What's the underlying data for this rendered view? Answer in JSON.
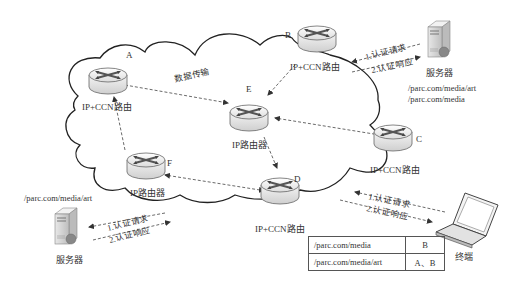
{
  "nodes": {
    "A": {
      "letter": "A",
      "label": "IP+CCN路由",
      "type": "IP+CCN router"
    },
    "B": {
      "letter": "B",
      "label": "IP+CCN路由",
      "type": "IP+CCN router"
    },
    "C": {
      "letter": "C",
      "label": "IP+CCN路由",
      "type": "IP+CCN router"
    },
    "D": {
      "letter": "D",
      "label": "IP+CCN路由",
      "type": "IP+CCN router"
    },
    "E": {
      "letter": "E",
      "label": "IP路由器",
      "type": "IP router"
    },
    "F": {
      "letter": "F",
      "label": "IP路由器",
      "type": "IP router"
    }
  },
  "edges": [
    {
      "from": "A",
      "to": "E",
      "label": "数据传输",
      "style": "dashed-bidirectional"
    },
    {
      "from": "B",
      "to": "E",
      "label": "",
      "style": "dashed-arrow"
    },
    {
      "from": "C",
      "to": "E",
      "label": "",
      "style": "dashed-bidirectional"
    },
    {
      "from": "E",
      "to": "D",
      "label": "",
      "style": "dashed-arrow"
    },
    {
      "from": "F",
      "to": "A",
      "label": "",
      "style": "dashed-arrow"
    },
    {
      "from": "D",
      "to": "F",
      "label": "",
      "style": "dashed-bidirectional"
    }
  ],
  "server_top": {
    "label": "服务器",
    "paths": [
      "/parc.com/media/art",
      "/parc.com/media"
    ],
    "request": "1.认证请求",
    "response": "2.认证响应"
  },
  "server_bottom": {
    "label": "服务器",
    "paths": [
      "/parc.com/media/art"
    ],
    "request": "1.认证请求",
    "response": "2.认证响应"
  },
  "terminal": {
    "label": "终端",
    "request": "1.认证请求",
    "response": "2.认证响应"
  },
  "routing_table": {
    "rows": [
      {
        "prefix": "/parc.com/media",
        "routers": "B"
      },
      {
        "prefix": "/parc.com/media/art",
        "routers": "A、B"
      }
    ]
  },
  "colors": {
    "line": "#222222",
    "dashed": "#444444",
    "router_body": "#e6e6e6",
    "router_arrow": "#555555"
  }
}
